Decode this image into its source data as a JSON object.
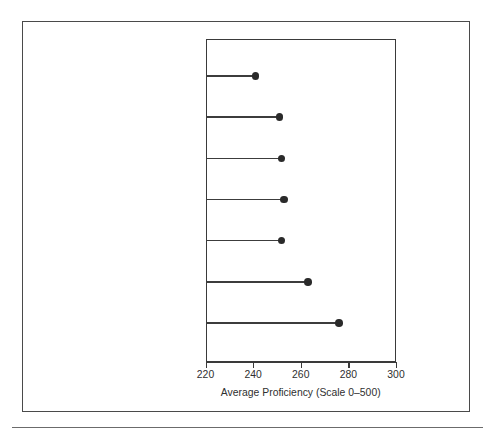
{
  "figure": {
    "background_color": "#ffffff",
    "border_color": "#4a4a4a",
    "rule_color": "#6b6b6b"
  },
  "chart_data": {
    "type": "scatter",
    "subtype": "lollipop-dot-plot",
    "orientation": "horizontal",
    "title": "",
    "subtitle": "",
    "xlabel": "Average Proficiency (Scale 0–500)",
    "ylabel": "",
    "xlim": [
      220,
      300
    ],
    "ylim": null,
    "grid": false,
    "legend": null,
    "xticks": [
      220,
      240,
      260,
      280,
      300
    ],
    "xticklabels": [
      "220",
      "240",
      "260",
      "280",
      "300"
    ],
    "categories": [
      "Greater than 45%",
      "Between 41 and 45%",
      "Between 36 and 40%",
      "Between 36 and 40%",
      "Between 31 and 35%",
      "Between 26 and 30%",
      "Between 21 and 25%"
    ],
    "values": [
      241,
      251,
      252,
      253,
      252,
      263,
      276
    ],
    "marker": {
      "shape": "circle",
      "color": "#2a2a2a",
      "size_px": 7.6
    },
    "stem": {
      "color": "#3c3c3c",
      "width_px": 1.5,
      "baseline": 220
    },
    "axis_color": "#3a3a3a"
  }
}
